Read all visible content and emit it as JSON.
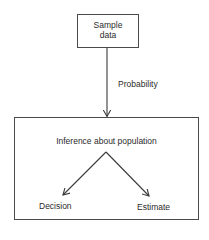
{
  "diagram": {
    "top_box": {
      "line1": "Sample",
      "line2": "data"
    },
    "arrow_label": "Probability",
    "bottom_box": {
      "heading": "Inference about population",
      "left_outcome": "Decision",
      "right_outcome": "Estimate"
    },
    "colors": {
      "stroke": "#3a3a3a",
      "background": "#ffffff",
      "text": "#2b2b2b"
    }
  }
}
